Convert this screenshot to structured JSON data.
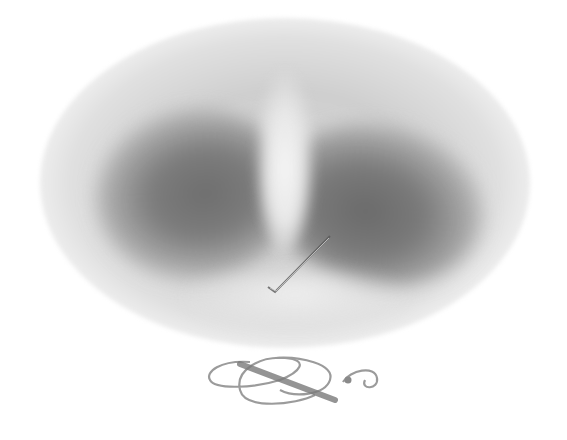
{
  "image": {
    "subject": "grey marabou feathers in oval vignette",
    "ornament": "decorative scroll flourish",
    "colors": {
      "background": "#ffffff",
      "feather_dark": "#6e6e6e",
      "feather_mid": "#a6a6a6",
      "highlight": "#f5f5f5",
      "flourish": "#8a8a8a"
    }
  }
}
